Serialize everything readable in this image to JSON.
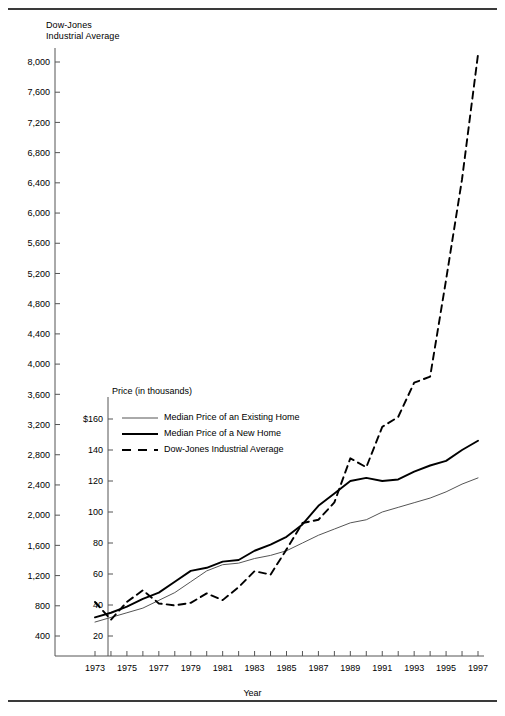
{
  "figure": {
    "dow_axis_title": "Dow-Jones\nIndustrial Average",
    "price_axis_title": "Price (in thousands)",
    "x_axis_title": "Year"
  },
  "legend": {
    "items": [
      {
        "label": "Median Price of an Existing Home",
        "style": "thin-solid"
      },
      {
        "label": "Median Price of a New Home",
        "style": "thick-solid"
      },
      {
        "label": "Dow-Jones Industrial Average",
        "style": "dashed"
      }
    ]
  },
  "chart_data": {
    "type": "line",
    "title": "",
    "xlabel": "Year",
    "ylabel": "Dow-Jones Industrial Average",
    "y2label": "Price (in thousands)",
    "grid": false,
    "legend_position": "inside-left",
    "x": [
      1973,
      1974,
      1975,
      1976,
      1977,
      1978,
      1979,
      1980,
      1981,
      1982,
      1983,
      1984,
      1985,
      1986,
      1987,
      1988,
      1989,
      1990,
      1991,
      1992,
      1993,
      1994,
      1995,
      1996,
      1997
    ],
    "xlim": [
      1973,
      1997
    ],
    "xticks": [
      1973,
      1974,
      1975,
      1976,
      1977,
      1978,
      1979,
      1980,
      1981,
      1982,
      1983,
      1984,
      1985,
      1986,
      1987,
      1988,
      1989,
      1990,
      1991,
      1992,
      1993,
      1994,
      1995,
      1996,
      1997
    ],
    "xticklabels": [
      "1973",
      "",
      "1975",
      "",
      "1977",
      "",
      "1979",
      "",
      "1981",
      "",
      "1983",
      "",
      "1985",
      "",
      "1987",
      "",
      "1989",
      "",
      "1991",
      "",
      "1993",
      "",
      "1995",
      "",
      "1997"
    ],
    "ylim": [
      0,
      8200
    ],
    "yticks": [
      400,
      800,
      1200,
      1600,
      2000,
      2400,
      2800,
      3200,
      3600,
      4000,
      4400,
      4800,
      5200,
      5600,
      6000,
      6400,
      6800,
      7200,
      7600,
      8000
    ],
    "yticklabels": [
      "400",
      "800",
      "1,200",
      "1,600",
      "2,000",
      "2,400",
      "2,800",
      "3,200",
      "3,600",
      "4,000",
      "4,400",
      "4,800",
      "5,200",
      "5,600",
      "6,000",
      "6,400",
      "6,800",
      "7,200",
      "7,600",
      "8,000"
    ],
    "y2lim": [
      0,
      164
    ],
    "y2ticks": [
      20,
      40,
      60,
      80,
      100,
      120,
      140,
      160
    ],
    "y2ticklabels": [
      "20",
      "40",
      "60",
      "80",
      "100",
      "120",
      "140",
      "$160"
    ],
    "series": [
      {
        "name": "Median Price of an Existing Home",
        "axis": "y2",
        "style": "thin-solid",
        "values": [
          29,
          32,
          35,
          38,
          43,
          48,
          55,
          62,
          66,
          67,
          70,
          72,
          75,
          80,
          85,
          89,
          93,
          95,
          100,
          103,
          106,
          109,
          113,
          118,
          122
        ]
      },
      {
        "name": "Median Price of a New Home",
        "axis": "y2",
        "style": "thick-solid",
        "values": [
          32,
          35,
          39,
          44,
          48,
          55,
          62,
          64,
          68,
          69,
          75,
          79,
          84,
          92,
          104,
          112,
          120,
          122,
          120,
          121,
          126,
          130,
          133,
          140,
          146
        ]
      },
      {
        "name": "Dow-Jones Industrial Average",
        "axis": "y1",
        "style": "dashed",
        "values": [
          850,
          616,
          852,
          1005,
          831,
          805,
          839,
          964,
          875,
          1047,
          1259,
          1212,
          1547,
          1896,
          1939,
          2169,
          2753,
          2634,
          3169,
          3301,
          3754,
          3834,
          5117,
          6448,
          8100
        ]
      }
    ]
  }
}
